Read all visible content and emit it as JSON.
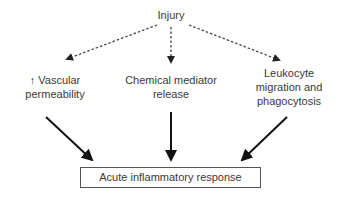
{
  "diagram": {
    "root": {
      "label": "Injury"
    },
    "causes": [
      {
        "id": "vascular",
        "lines": [
          "↑ Vascular",
          "permeability"
        ]
      },
      {
        "id": "chemical",
        "lines": [
          "Chemical mediator",
          "release"
        ]
      },
      {
        "id": "leukocyte",
        "lines": [
          "Leukocyte",
          "migration and",
          "phagocytosis"
        ]
      }
    ],
    "outcome": {
      "label": "Acute inflammatory response"
    },
    "edges": [
      {
        "from": "Injury",
        "to": "↑ Vascular permeability",
        "style": "dashed"
      },
      {
        "from": "Injury",
        "to": "Chemical mediator release",
        "style": "dashed"
      },
      {
        "from": "Injury",
        "to": "Leukocyte migration and phagocytosis",
        "style": "dashed"
      },
      {
        "from": "↑ Vascular permeability",
        "to": "Acute inflammatory response",
        "style": "solid"
      },
      {
        "from": "Chemical mediator release",
        "to": "Acute inflammatory response",
        "style": "solid"
      },
      {
        "from": "Leukocyte migration and phagocytosis",
        "to": "Acute inflammatory response",
        "style": "solid"
      }
    ],
    "colors": {
      "text": "#3a3a3a",
      "dashed_arrow": "#444444",
      "solid_arrow": "#111111",
      "box_border": "#555555"
    }
  }
}
